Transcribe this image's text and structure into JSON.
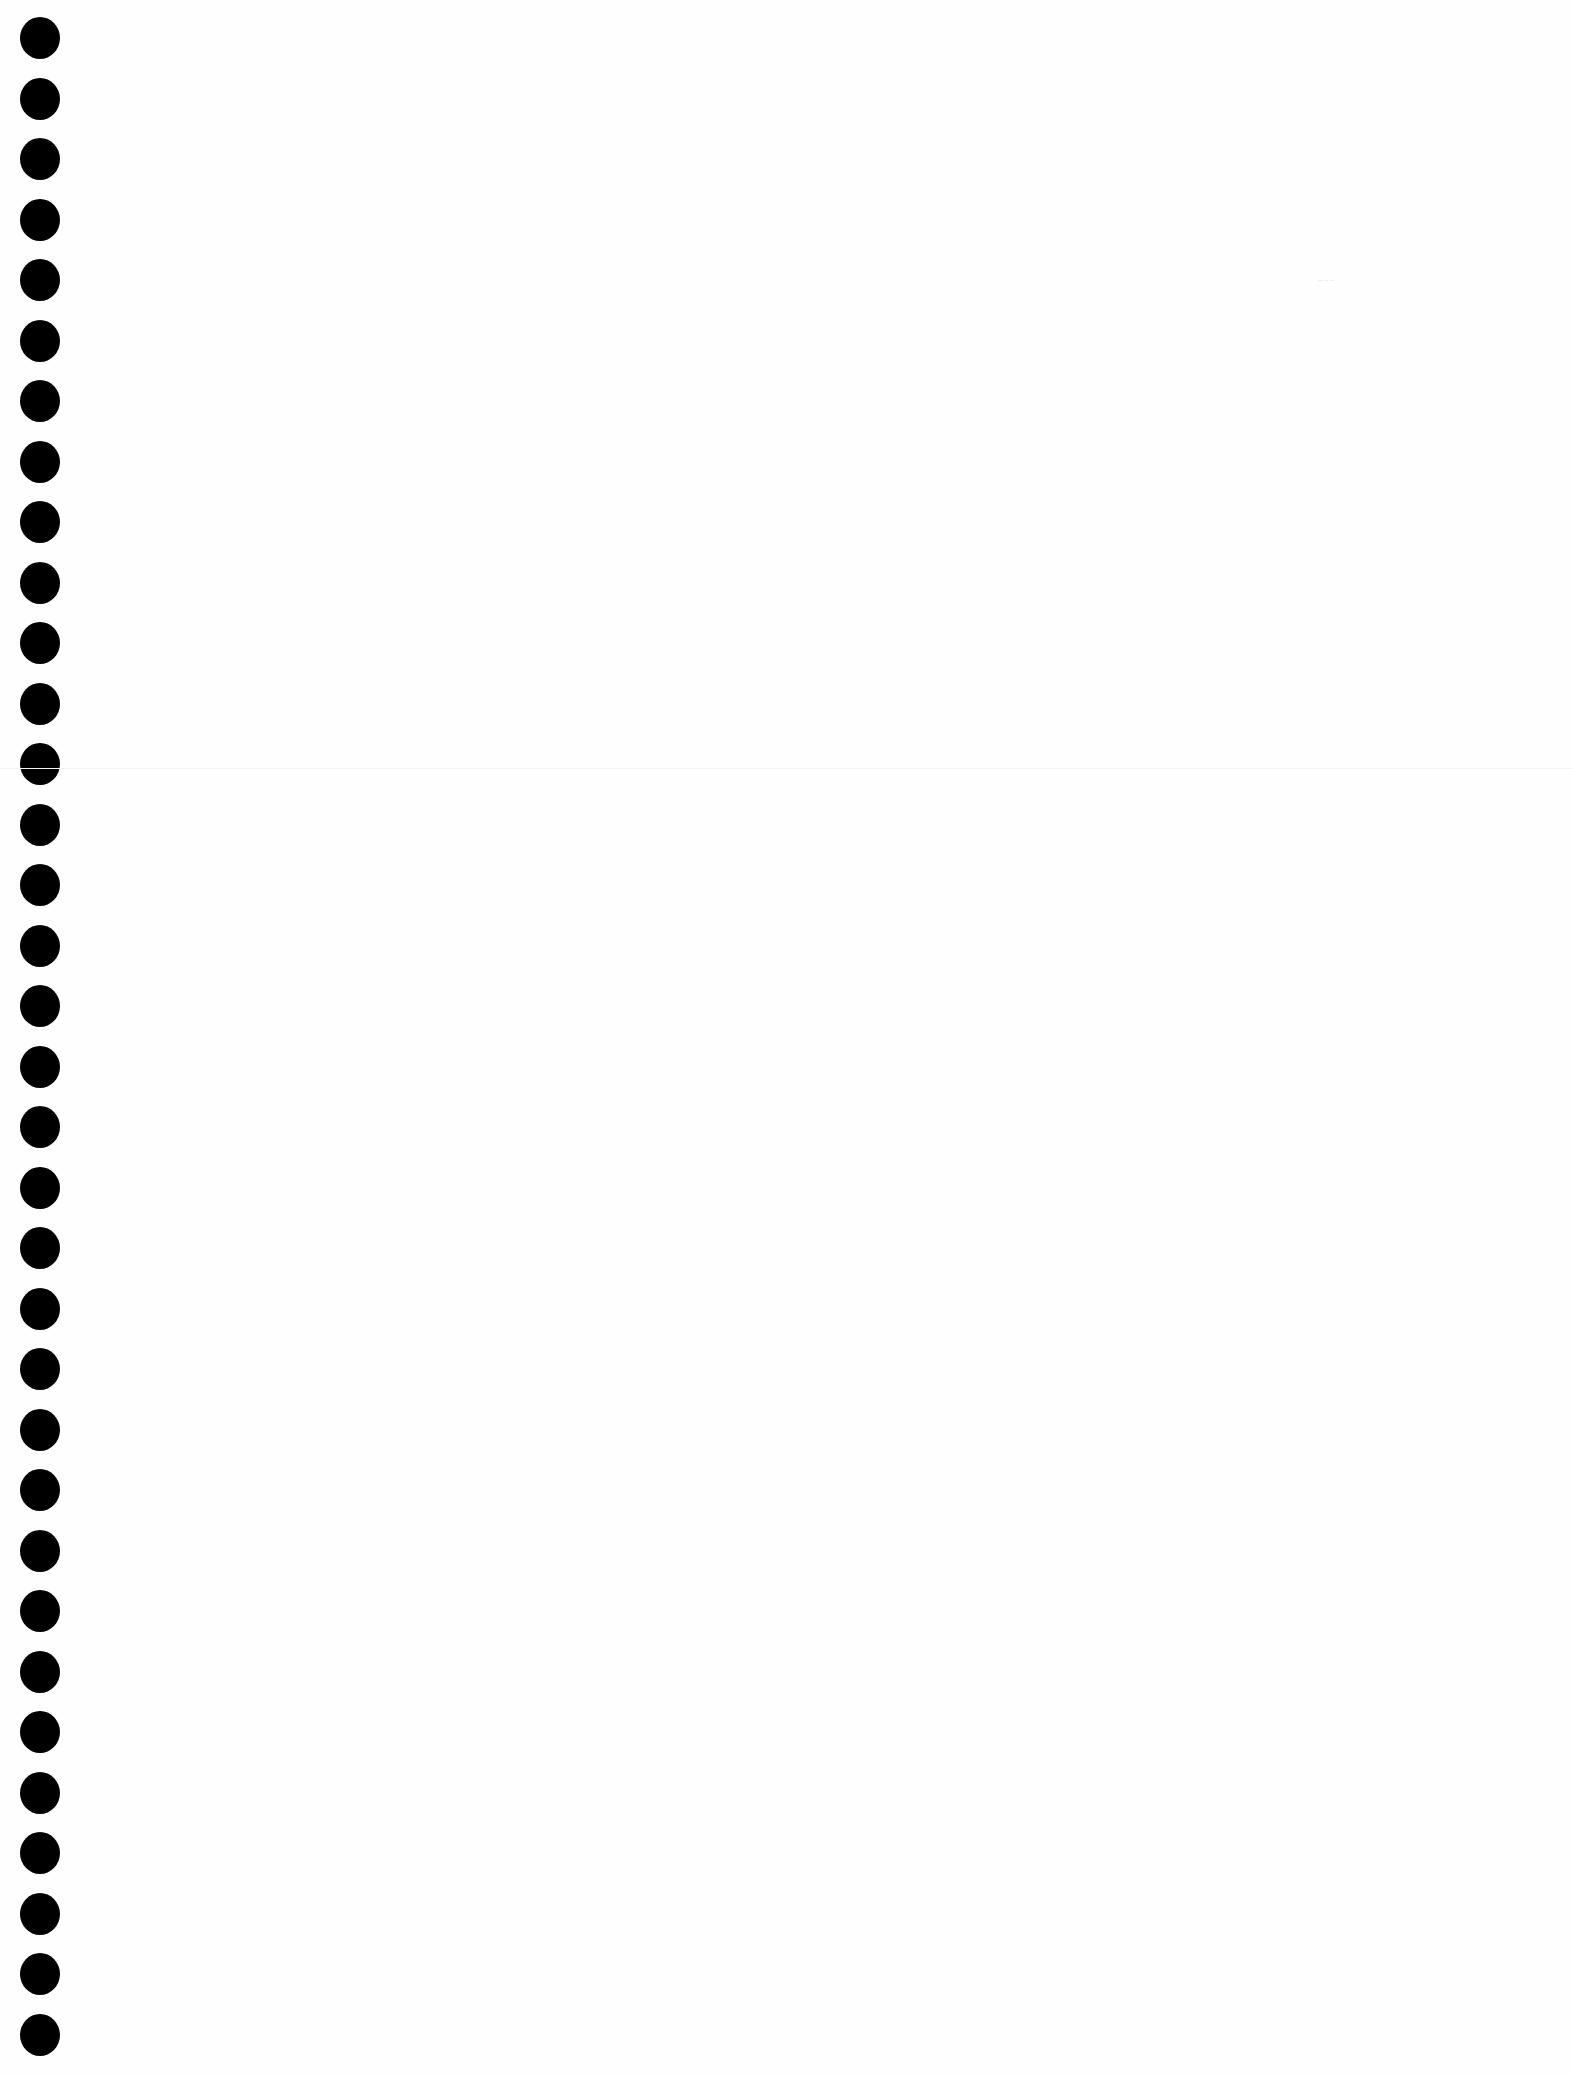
{
  "page": {
    "type": "blank-punched-sheet",
    "background_color": "#fefefe",
    "hole_color": "#000000",
    "hole_count": 34,
    "hole_spacing_px": 60.5,
    "hole_diameter_px": 40,
    "first_hole_center_y": 38,
    "hole_center_x": 40
  },
  "marks": {
    "scan_smudge_text": "~~~"
  }
}
